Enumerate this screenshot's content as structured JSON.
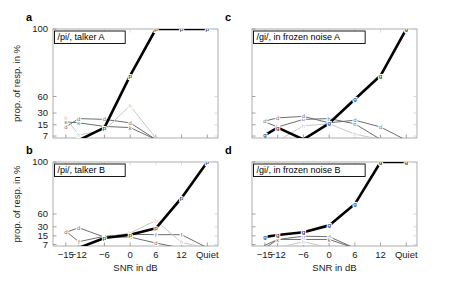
{
  "figure": {
    "axis": {
      "xlabel": "SNR in dB",
      "ylabel": "prop. of resp. in %",
      "xticks": [
        "−15",
        "−12",
        "−6",
        "0",
        "6",
        "12",
        "Quiet"
      ],
      "yticks": [
        "100",
        "60",
        "30",
        "15",
        "7"
      ],
      "xlim": [
        -18,
        18
      ],
      "ylim_pct": [
        5,
        100
      ],
      "yscale": "logit-like",
      "grid": false
    },
    "panels": [
      {
        "letter": "a",
        "title": "/pi/, talker A"
      },
      {
        "letter": "b",
        "title": "/pi/, talker B"
      },
      {
        "letter": "c",
        "title": "/gi/, in frozen noise A"
      },
      {
        "letter": "d",
        "title": "/gi/, in frozen noise B"
      }
    ]
  },
  "colors": {
    "target": "#000000",
    "mid_gray": "#6e6e6e",
    "light_gray": "#a8a8a8",
    "pale_gray": "#c8c8c8"
  },
  "chart_data": {
    "type": "line",
    "xlabel": "SNR in dB",
    "ylabel": "prop. of resp. in %",
    "categories": [
      "-15",
      "-12",
      "-6",
      "0",
      "6",
      "12",
      "Quiet"
    ],
    "xtick_labels": [
      "−15",
      "−12",
      "−6",
      "0",
      "6",
      "12",
      "Quiet"
    ],
    "ytick_values": [
      100,
      60,
      30,
      15,
      7
    ],
    "ylim": [
      5,
      100
    ],
    "legend_position": "none",
    "panels": [
      {
        "id": "a",
        "label": "a",
        "title": "/pi/, talker A",
        "series": [
          {
            "name": "p",
            "marker": "p",
            "color": "#000000",
            "width": 2.6,
            "x": [
              "-15",
              "-12",
              "-6",
              "0",
              "6",
              "12",
              "Quiet"
            ],
            "values": [
              5.0,
              5.2,
              12.5,
              88,
              100,
              100,
              100
            ]
          },
          {
            "name": "k",
            "marker": "k",
            "color": "#6e6e6e",
            "width": 1.0,
            "x": [
              "-15",
              "-12",
              "-6",
              "0",
              "6",
              "12",
              "Quiet"
            ],
            "values": [
              18,
              17,
              13.5,
              12.5,
              5.5,
              5.0,
              5.0
            ]
          },
          {
            "name": "d",
            "marker": "d",
            "color": "#6e6e6e",
            "width": 1.0,
            "x": [
              "-15",
              "-12",
              "-6",
              "0",
              "6",
              "12",
              "Quiet"
            ],
            "values": [
              13,
              22,
              21,
              17,
              5.5,
              5.0,
              5.0
            ]
          },
          {
            "name": "h",
            "marker": "h",
            "color": "#c8c8c8",
            "width": 1.0,
            "x": [
              "-15",
              "-12",
              "-6",
              "0",
              "6",
              "12",
              "Quiet"
            ],
            "values": [
              23,
              7.5,
              10.5,
              43,
              6.0,
              5.0,
              5.0
            ]
          }
        ]
      },
      {
        "id": "b",
        "label": "b",
        "title": "/pi/, talker B",
        "series": [
          {
            "name": "p",
            "marker": "p",
            "color": "#000000",
            "width": 2.6,
            "x": [
              "-15",
              "-12",
              "-6",
              "0",
              "6",
              "12",
              "Quiet"
            ],
            "values": [
              5.0,
              5.1,
              12.5,
              16.5,
              27,
              88,
              100
            ]
          },
          {
            "name": "f",
            "marker": "f",
            "color": "#6e6e6e",
            "width": 1.0,
            "x": [
              "-15",
              "-12",
              "-6",
              "0",
              "6",
              "12",
              "Quiet"
            ],
            "values": [
              22,
              9.0,
              14.5,
              17,
              16.5,
              16.5,
              5.2
            ]
          },
          {
            "name": "d",
            "marker": "d",
            "color": "#6e6e6e",
            "width": 1.0,
            "x": [
              "-15",
              "-12",
              "-6",
              "0",
              "6",
              "12",
              "Quiet"
            ],
            "values": [
              20,
              28,
              13.5,
              13.5,
              8.0,
              5.0,
              5.0
            ]
          },
          {
            "name": "h",
            "marker": "h",
            "color": "#c8c8c8",
            "width": 1.0,
            "x": [
              "-15",
              "-12",
              "-6",
              "0",
              "6",
              "12",
              "Quiet"
            ],
            "values": [
              5.0,
              5.0,
              13.0,
              19,
              44,
              8.5,
              5.0
            ]
          }
        ]
      },
      {
        "id": "c",
        "label": "c",
        "title": "/gi/, in frozen noise A",
        "series": [
          {
            "name": "g",
            "marker": "g",
            "color": "#000000",
            "width": 2.6,
            "x": [
              "-15",
              "-12",
              "-6",
              "0",
              "6",
              "12",
              "Quiet"
            ],
            "values": [
              7.5,
              12.5,
              5.5,
              16.5,
              55,
              88,
              100
            ]
          },
          {
            "name": "b",
            "marker": "b",
            "color": "#6e6e6e",
            "width": 1.0,
            "x": [
              "-15",
              "-12",
              "-6",
              "0",
              "6",
              "12",
              "Quiet"
            ],
            "values": [
              18,
              13,
              21,
              22,
              16,
              5.5,
              5.0
            ]
          },
          {
            "name": "d",
            "marker": "d",
            "color": "#6e6e6e",
            "width": 1.0,
            "x": [
              "-15",
              "-12",
              "-6",
              "0",
              "6",
              "12",
              "Quiet"
            ],
            "values": [
              19,
              23,
              25,
              17,
              20,
              13,
              5.2
            ]
          },
          {
            "name": "h",
            "marker": "h",
            "color": "#c8c8c8",
            "width": 1.0,
            "x": [
              "-15",
              "-12",
              "-6",
              "0",
              "6",
              "12",
              "Quiet"
            ],
            "values": [
              5.0,
              5.0,
              14,
              16,
              8.0,
              5.5,
              5.0
            ]
          }
        ]
      },
      {
        "id": "d",
        "label": "d",
        "title": "/gi/, in frozen noise B",
        "series": [
          {
            "name": "g",
            "marker": "g",
            "color": "#000000",
            "width": 2.6,
            "x": [
              "-15",
              "-12",
              "-6",
              "0",
              "6",
              "12",
              "Quiet"
            ],
            "values": [
              13.5,
              16,
              20,
              33,
              80,
              100,
              100
            ]
          },
          {
            "name": "d",
            "marker": "d",
            "color": "#6e6e6e",
            "width": 1.0,
            "x": [
              "-15",
              "-12",
              "-6",
              "0",
              "6",
              "12",
              "Quiet"
            ],
            "values": [
              6.5,
              11,
              14.5,
              14.0,
              5.0,
              5.0,
              5.0
            ]
          },
          {
            "name": "k",
            "marker": "k",
            "color": "#6e6e6e",
            "width": 1.0,
            "x": [
              "-15",
              "-12",
              "-6",
              "0",
              "6",
              "12",
              "Quiet"
            ],
            "values": [
              5.0,
              11,
              11,
              11,
              5.0,
              5.0,
              5.0
            ]
          },
          {
            "name": "h",
            "marker": "h",
            "color": "#c8c8c8",
            "width": 1.0,
            "x": [
              "-15",
              "-12",
              "-6",
              "0",
              "6",
              "12",
              "Quiet"
            ],
            "values": [
              5.0,
              5.2,
              9.0,
              5.2,
              5.0,
              5.0,
              5.0
            ]
          }
        ]
      }
    ]
  }
}
